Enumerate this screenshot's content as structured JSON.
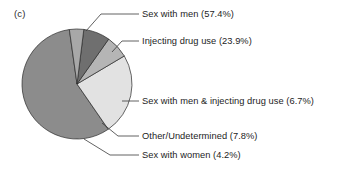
{
  "panel": {
    "label": "(c)"
  },
  "chart_data": {
    "type": "pie",
    "title": "",
    "subtitle": "",
    "xlabel": "",
    "ylabel": "",
    "grid": false,
    "legend_position": "callout-labels-right",
    "total_percent": 100.0,
    "categories": [
      "Sex with men",
      "Injecting drug use",
      "Sex with men & injecting drug use",
      "Other/Undetermined",
      "Sex with women"
    ],
    "values": [
      57.4,
      23.9,
      6.7,
      7.8,
      4.2
    ],
    "slices": [
      {
        "name": "sex-with-men",
        "label": "Sex with men (57.4%)",
        "category": "Sex with men",
        "value": 57.4,
        "color": "#8c8c8c"
      },
      {
        "name": "injecting-drug-use",
        "label": "Injecting drug use (23.9%)",
        "category": "Injecting drug use",
        "value": 23.9,
        "color": "#e2e2e2"
      },
      {
        "name": "sex-with-men-and-injecting-drug-use",
        "label": "Sex with men & injecting drug use (6.7%)",
        "category": "Sex with men & injecting drug use",
        "value": 6.7,
        "color": "#b5b5b5"
      },
      {
        "name": "other-undetermined",
        "label": "Other/Undetermined (7.8%)",
        "category": "Other/Undetermined",
        "value": 7.8,
        "color": "#6f6f6f"
      },
      {
        "name": "sex-with-women",
        "label": "Sex with women (4.2%)",
        "category": "Sex with women",
        "value": 4.2,
        "color": "#a8a8a8"
      }
    ]
  },
  "colors": {
    "background": "#ffffff",
    "text": "#1d1d1d",
    "leader_line": "#3a3a3a",
    "slice_outline": "#2a2a2a"
  }
}
